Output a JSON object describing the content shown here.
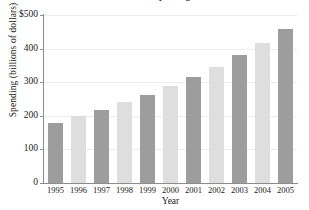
{
  "chart_data": {
    "type": "bar",
    "title": "National Spending",
    "xlabel": "Year",
    "ylabel": "Spending (billions of dollars)",
    "categories": [
      "1995",
      "1996",
      "1997",
      "1998",
      "1999",
      "2000",
      "2001",
      "2002",
      "2003",
      "2004",
      "2005"
    ],
    "values": [
      178,
      200,
      218,
      240,
      263,
      288,
      315,
      345,
      380,
      416,
      458
    ],
    "bar_shades": [
      "dark",
      "light",
      "dark",
      "light",
      "dark",
      "light",
      "dark",
      "light",
      "dark",
      "light",
      "dark"
    ],
    "ylim": [
      0,
      500
    ],
    "yticks": [
      0,
      100,
      200,
      300,
      400,
      500
    ],
    "ytick_labels": [
      "0",
      "100",
      "200",
      "300",
      "400",
      "$500"
    ],
    "grid": true,
    "legend": "none",
    "colors": {
      "bar_dark": "#9d9d9d",
      "bar_light": "#dedede",
      "axis": "#8c8c8c",
      "gridline": "#ededed",
      "text": "#1a1a1a",
      "background": "#ffffff"
    }
  }
}
